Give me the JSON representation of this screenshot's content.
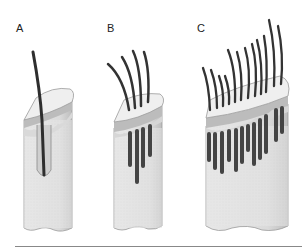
{
  "figure": {
    "panels": [
      {
        "label": "A",
        "hairs": 1,
        "description": "single hair follicle in skin section"
      },
      {
        "label": "B",
        "hairs": 4,
        "description": "skin section with four hair follicles"
      },
      {
        "label": "C",
        "hairs": 14,
        "description": "wide skin section with many hair follicles"
      }
    ]
  },
  "colors": {
    "skin_body": "#e4e4e4",
    "skin_side": "#c8c8c8",
    "skin_top": "#efefef",
    "epidermis": "#b9b9b9",
    "hair": "#3a3a3a",
    "follicle": "#555555",
    "outline": "#9a9a9a",
    "baseline": "#888888"
  }
}
